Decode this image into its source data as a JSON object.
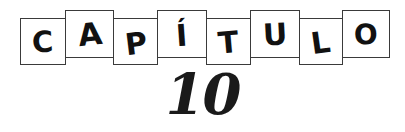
{
  "heading": {
    "word": "CAPÍTULO",
    "letters": [
      {
        "char": "C",
        "name": "letter-box-c",
        "x": 20,
        "y": 18,
        "w": 46,
        "h": 47,
        "tilt": "low"
      },
      {
        "char": "A",
        "name": "letter-box-a",
        "x": 65,
        "y": 10,
        "w": 49,
        "h": 48,
        "tilt": "high"
      },
      {
        "char": "P",
        "name": "letter-box-p",
        "x": 113,
        "y": 18,
        "w": 45,
        "h": 47,
        "tilt": "low"
      },
      {
        "char": "Í",
        "name": "letter-box-i",
        "x": 157,
        "y": 10,
        "w": 50,
        "h": 48,
        "tilt": "high"
      },
      {
        "char": "T",
        "name": "letter-box-t",
        "x": 206,
        "y": 18,
        "w": 45,
        "h": 47,
        "tilt": "low"
      },
      {
        "char": "U",
        "name": "letter-box-u",
        "x": 250,
        "y": 10,
        "w": 50,
        "h": 48,
        "tilt": "high"
      },
      {
        "char": "L",
        "name": "letter-box-l",
        "x": 299,
        "y": 18,
        "w": 44,
        "h": 47,
        "tilt": "low"
      },
      {
        "char": "O",
        "name": "letter-box-o",
        "x": 342,
        "y": 10,
        "w": 48,
        "h": 48,
        "tilt": "high"
      }
    ]
  },
  "chapter": {
    "number": "10"
  },
  "colors": {
    "background": "#ffffff",
    "ink": "#111111",
    "box_stroke": "#3a3a3a",
    "number_ink": "#1a1a1a"
  }
}
